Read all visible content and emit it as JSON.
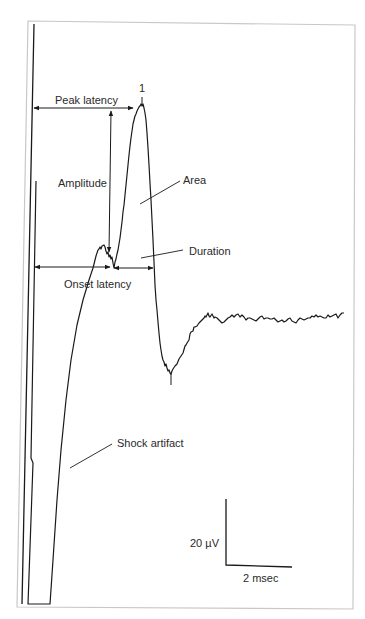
{
  "figure": {
    "type": "evoked-potential-waveform-diagram",
    "peak_marker": "1",
    "labels": {
      "peak_latency": "Peak latency",
      "amplitude": "Amplitude",
      "area": "Area",
      "duration": "Duration",
      "onset_latency": "Onset latency",
      "shock_artifact": "Shock artifact"
    },
    "scale_bar": {
      "vertical_label": "20 µV",
      "horizontal_label": "2 msec"
    },
    "colors": {
      "trace": "#1a1a1a",
      "text": "#2a2a2a",
      "frame": "#c8c8c8",
      "background": "#ffffff"
    }
  }
}
